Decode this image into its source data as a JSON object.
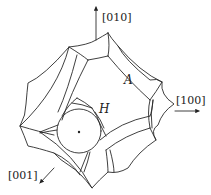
{
  "diagram": {
    "title": "",
    "type": "crystal-pore-structure",
    "axes": [
      {
        "id": "y",
        "label": "[010]",
        "direction": "up"
      },
      {
        "id": "x",
        "label": "[100]",
        "direction": "right"
      },
      {
        "id": "z",
        "label": "[001]",
        "direction": "down-left"
      }
    ],
    "labels": {
      "channel": "A",
      "hole": "H"
    },
    "colors": {
      "stroke": "#2a2a2a",
      "background": "#ffffff"
    }
  }
}
